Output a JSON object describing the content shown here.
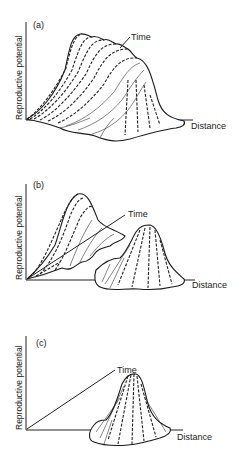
{
  "figure": {
    "panels": [
      {
        "id": "a",
        "tag": "(a)",
        "y_axis_label": "Reproductive potential",
        "x_axis_label": "Distance",
        "time_axis_label": "Time",
        "description": "A single broad ridge of reproductive potential that drifts along the distance axis over time"
      },
      {
        "id": "b",
        "tag": "(b)",
        "y_axis_label": "Reproductive potential",
        "x_axis_label": "Distance",
        "time_axis_label": "Time",
        "description": "Two separate peaks: one early in time near origin, one later shifted along distance"
      },
      {
        "id": "c",
        "tag": "(c)",
        "y_axis_label": "Reproductive potential",
        "x_axis_label": "Distance",
        "time_axis_label": "Time",
        "description": "A single narrow peak displaced along distance with time axis drawn as straight line"
      }
    ]
  }
}
